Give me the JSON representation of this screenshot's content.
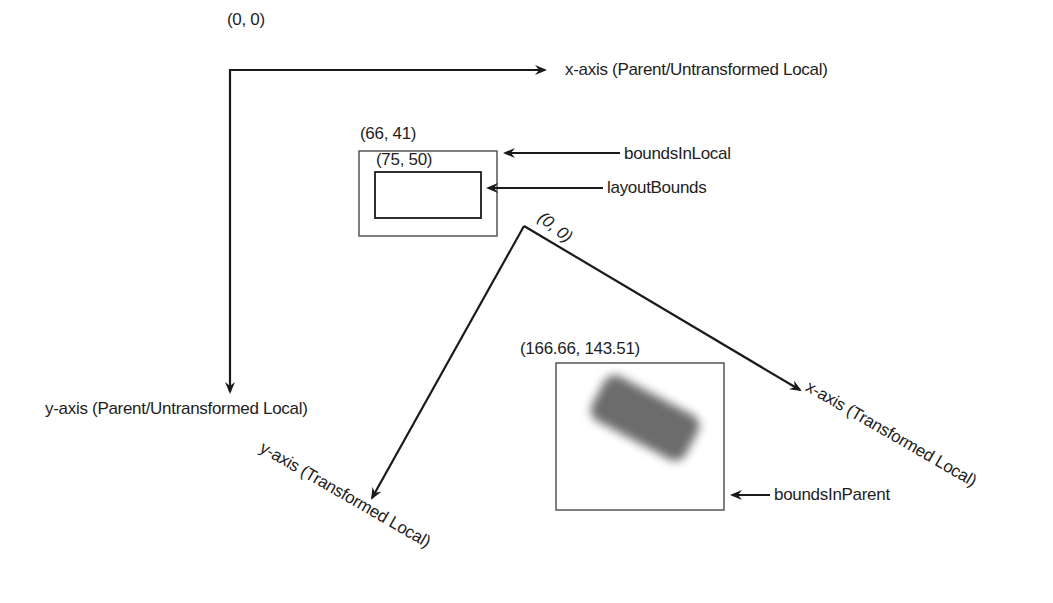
{
  "diagram": {
    "parent_axes": {
      "origin_label": "(0, 0)",
      "x_axis_label": "x-axis (Parent/Untransformed Local)",
      "y_axis_label": "y-axis (Parent/Untransformed Local)"
    },
    "local_bounds": {
      "bounds_in_local_origin": "(66, 41)",
      "bounds_in_local_label": "boundsInLocal",
      "layout_bounds_origin": "(75, 50)",
      "layout_bounds_label": "layoutBounds"
    },
    "transformed_axes": {
      "origin_label": "(0, 0)",
      "x_axis_label": "x-axis (Transformed Local)",
      "y_axis_label": "y-axis (Transformed Local)"
    },
    "parent_bounds": {
      "origin_label": "(166.66, 143.51)",
      "bounds_in_parent_label": "boundsInParent",
      "shape": "rotated-rounded-rectangle"
    },
    "colors": {
      "line": "#1a1a1a",
      "box_border": "#555555",
      "shape_fill": "#6c6c6c",
      "background": "#ffffff"
    }
  }
}
